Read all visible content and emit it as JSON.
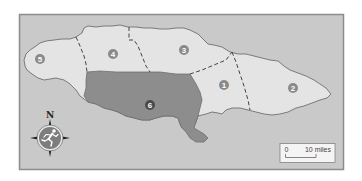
{
  "map": {
    "colors": {
      "sea": "#c9c9c9",
      "frame_border": "#8c8c8c",
      "land": "#e4e4e4",
      "coastline": "#7a7a7a",
      "highlighted_region": "#8d8d8d",
      "boundary": "#444444",
      "label_circle": "#8a8a8a",
      "label_circle_highlighted": "#4a4a4a",
      "label_text": "#ffffff",
      "compass_disc": "#7d7d7d",
      "compass_ring": "#e8e8e8",
      "compass_points": "#1a1a1a",
      "scale_box": "#f4f4f4"
    },
    "regions": [
      {
        "id": "1",
        "label": "1",
        "highlighted": false
      },
      {
        "id": "2",
        "label": "2",
        "highlighted": false
      },
      {
        "id": "3",
        "label": "3",
        "highlighted": false
      },
      {
        "id": "4",
        "label": "4",
        "highlighted": false
      },
      {
        "id": "5",
        "label": "5",
        "highlighted": false
      },
      {
        "id": "6",
        "label": "6",
        "highlighted": true
      }
    ],
    "compass": {
      "north_label": "N",
      "icon": "running-person-icon"
    },
    "scale_bar": {
      "start_label": "0",
      "end_label": "10 miles"
    }
  }
}
